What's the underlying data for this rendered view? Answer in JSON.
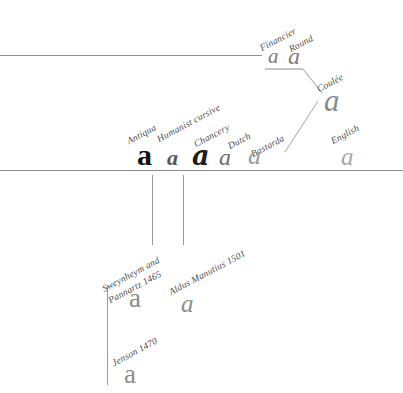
{
  "diagram": {
    "background_color": "#ffffff",
    "rule_color": "#8e8e8e",
    "rules": [
      {
        "name": "upper-rule",
        "x": 0,
        "y": 55,
        "width": 262
      },
      {
        "name": "lower-rule",
        "x": 0,
        "y": 170,
        "width": 403
      }
    ],
    "nodes": [
      {
        "id": "antiqua",
        "label": "Antiqua",
        "glyph": "a",
        "style": "g-antiqua",
        "color": "#111111",
        "label_x": 130,
        "label_y": 136,
        "glyph_x": 136,
        "glyph_y": 140
      },
      {
        "id": "humanist-cursive",
        "label": "Humanist cursive",
        "glyph": "a",
        "style": "g-humanist",
        "color": "#565656",
        "label_x": 160,
        "label_y": 134,
        "glyph_x": 167,
        "glyph_y": 147
      },
      {
        "id": "chancery",
        "label": "Chancery",
        "glyph": "a",
        "style": "g-chancery",
        "color": "#1d1d1d",
        "label_x": 196,
        "label_y": 139,
        "glyph_x": 192,
        "glyph_y": 142
      },
      {
        "id": "dutch",
        "label": "Dutch",
        "glyph": "a",
        "style": "g-dutch",
        "color": "#6b6b6b",
        "label_x": 230,
        "label_y": 141,
        "glyph_x": 219,
        "glyph_y": 145
      },
      {
        "id": "bastarda",
        "label": "Bastarda",
        "glyph": "a",
        "style": "g-bastarda",
        "color": "#9c9c9c",
        "label_x": 253,
        "label_y": 147,
        "glyph_x": 247,
        "glyph_y": 143
      },
      {
        "id": "english",
        "label": "English",
        "glyph": "a",
        "style": "g-english",
        "color": "#a8a8a8",
        "label_x": 333,
        "label_y": 136,
        "glyph_x": 340,
        "glyph_y": 144
      },
      {
        "id": "financier",
        "label": "Financier",
        "glyph": "a",
        "style": "g-financier",
        "color": "#7d7d7d",
        "label_x": 263,
        "label_y": 43,
        "glyph_x": 268,
        "glyph_y": 46
      },
      {
        "id": "round",
        "label": "Round",
        "glyph": "a",
        "style": "g-round",
        "color": "#7d7d7d",
        "label_x": 289,
        "label_y": 44,
        "glyph_x": 288,
        "glyph_y": 44
      },
      {
        "id": "coulee",
        "label": "Coulée",
        "glyph": "a",
        "style": "g-coulee",
        "color": "#8a8a8a",
        "label_x": 318,
        "label_y": 84,
        "glyph_x": 322,
        "glyph_y": 85
      },
      {
        "id": "sweynheym-pannartz",
        "label": "Sweynheym and\nPannartz 1465",
        "label_line1": "Sweynheym and",
        "label_line2": "Pannartz 1465",
        "glyph": "a",
        "style": "g-sweynheym",
        "color": "#8d8d8d",
        "label_x": 112,
        "label_y": 281,
        "glyph_x": 128,
        "glyph_y": 285
      },
      {
        "id": "aldus-manutius",
        "label": "Aldus Manutius 1501",
        "glyph": "a",
        "style": "g-aldus",
        "color": "#8d8d8d",
        "label_x": 172,
        "label_y": 287,
        "glyph_x": 181,
        "glyph_y": 291
      },
      {
        "id": "jenson",
        "label": "Jenson 1470",
        "glyph": "a",
        "style": "g-jenson",
        "color": "#8d8d8d",
        "label_x": 115,
        "label_y": 358,
        "glyph_x": 124,
        "glyph_y": 361
      }
    ],
    "vertical_lines": [
      {
        "name": "stem-sweynheym",
        "x": 152,
        "y": 175,
        "height": 70
      },
      {
        "name": "stem-aldus",
        "x": 183,
        "y": 175,
        "height": 70
      },
      {
        "name": "stem-jenson",
        "x": 107,
        "y": 286,
        "height": 99
      }
    ],
    "connectors": [
      {
        "name": "financier-round-bracket",
        "x1": 265,
        "y1": 69,
        "x2": 303,
        "y2": 69
      },
      {
        "name": "bracket-to-coulee",
        "x1": 303,
        "y1": 69,
        "x2": 322,
        "y2": 93
      },
      {
        "name": "coulee-to-bastarda",
        "x1": 318,
        "y1": 101,
        "x2": 285,
        "y2": 152
      }
    ]
  }
}
